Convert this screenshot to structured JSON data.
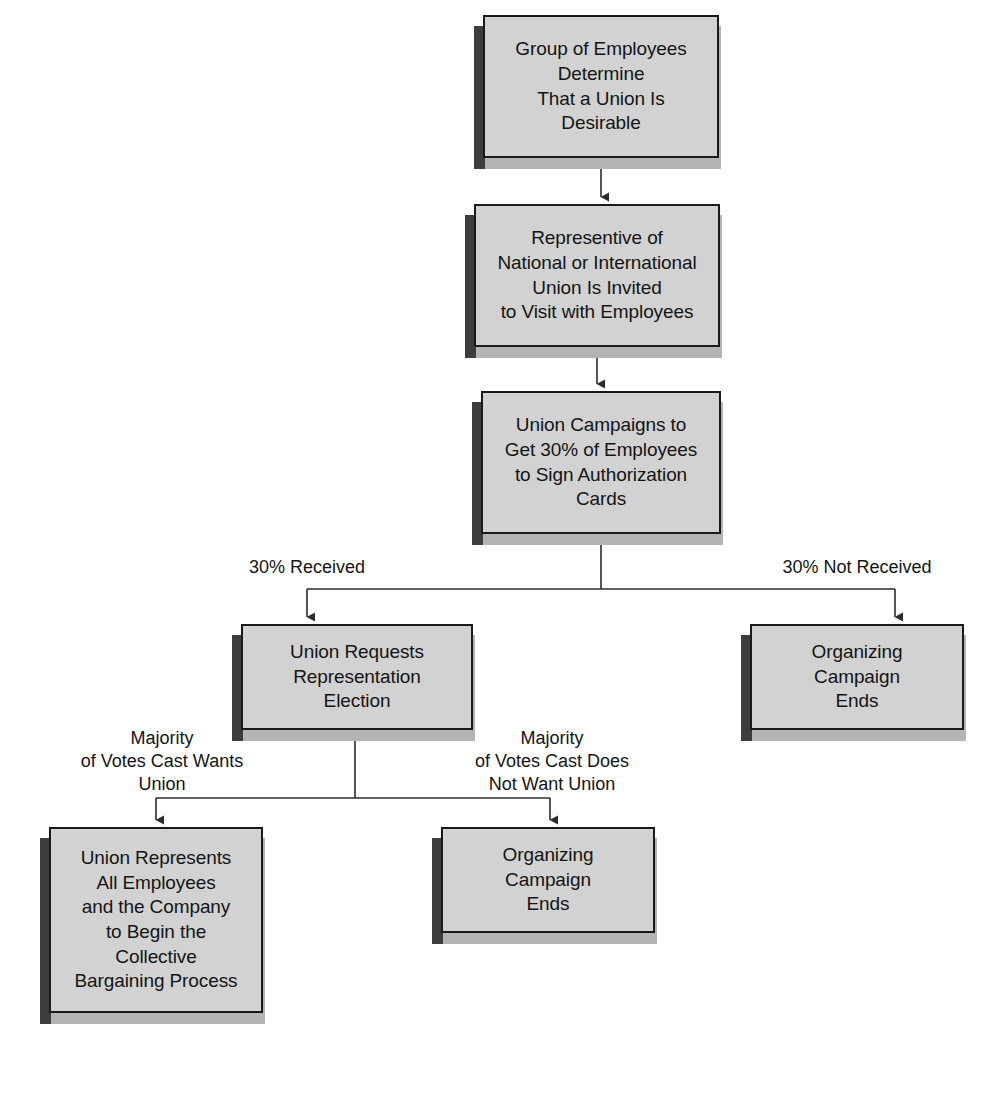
{
  "diagram": {
    "colors": {
      "box_fill": "#d2d2d2",
      "box_border": "#1a1a1a",
      "shadow_light": "#b4b4b4",
      "shadow_dark": "#3d3d3d",
      "line": "#2b2b2b",
      "text": "#141414",
      "background": "#ffffff"
    },
    "nodes": [
      {
        "id": "employees-determine",
        "label": "Group of Employees\nDetermine\nThat a Union Is\nDesirable",
        "x": 483,
        "y": 15,
        "w": 236,
        "h": 143
      },
      {
        "id": "representative-invited",
        "label": "Representive of\nNational or International\nUnion Is Invited\nto Visit with Employees",
        "x": 474,
        "y": 204,
        "w": 246,
        "h": 143
      },
      {
        "id": "union-campaigns",
        "label": "Union Campaigns to\nGet 30% of Employees\nto Sign Authorization\nCards",
        "x": 481,
        "y": 391,
        "w": 240,
        "h": 143
      },
      {
        "id": "union-requests-election",
        "label": "Union Requests\nRepresentation\nElection",
        "x": 241,
        "y": 624,
        "w": 232,
        "h": 106
      },
      {
        "id": "organizing-ends-right",
        "label": "Organizing\nCampaign\nEnds",
        "x": 750,
        "y": 624,
        "w": 214,
        "h": 106
      },
      {
        "id": "union-represents",
        "label": "Union Represents\nAll Employees\nand the Company\nto Begin the\nCollective\nBargaining Process",
        "x": 49,
        "y": 827,
        "w": 214,
        "h": 186
      },
      {
        "id": "organizing-ends-bottom",
        "label": "Organizing\nCampaign\nEnds",
        "x": 441,
        "y": 827,
        "w": 214,
        "h": 106
      }
    ],
    "edge_labels": [
      {
        "id": "pct-received",
        "text": "30% Received",
        "x": 187,
        "y": 556,
        "w": 240
      },
      {
        "id": "pct-not-received",
        "text": "30% Not Received",
        "x": 737,
        "y": 556,
        "w": 240
      },
      {
        "id": "majority-wants",
        "text": "Majority\nof Votes Cast Wants\nUnion",
        "x": 37,
        "y": 727,
        "w": 250
      },
      {
        "id": "majority-not-wants",
        "text": "Majority\nof Votes Cast Does\nNot Want Union",
        "x": 427,
        "y": 727,
        "w": 250
      }
    ],
    "connectors": [
      {
        "id": "employees-to-representative",
        "kind": "arrow-down"
      },
      {
        "id": "representative-to-campaigns",
        "kind": "arrow-down"
      },
      {
        "id": "campaigns-split",
        "kind": "split-left-right"
      },
      {
        "id": "election-split",
        "kind": "split-left-right"
      }
    ]
  }
}
